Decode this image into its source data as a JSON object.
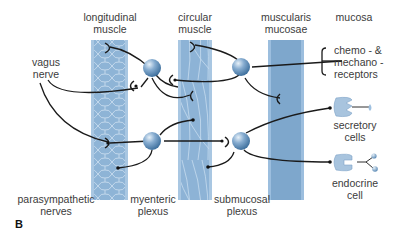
{
  "labels": {
    "longitudinal_muscle": "longitudinal\nmuscle",
    "circular_muscle": "circular\nmuscle",
    "muscularis_mucosae": "muscularis\nmucosae",
    "mucosa": "mucosa",
    "vagus_nerve": "vagus\nnerve",
    "receptors": "chemo - &\nmechano -\nreceptors",
    "secretory_cells": "secretory\ncells",
    "endocrine_cell": "endocrine\ncell",
    "parasympathetic_nerves": "parasympathetic\nnerves",
    "myenteric_plexus": "myenteric\nplexus",
    "submucosal_plexus": "submucosal\nplexus",
    "panel_letter": "B"
  },
  "colors": {
    "layer_fill": "#8fb3d4",
    "layer_edge": "#a9c7e2",
    "muscularis_fill": "#7ea7cc",
    "neuron": "#6f9cc4",
    "nerve_line": "#1a1a1a",
    "text": "#3b3b3b"
  }
}
